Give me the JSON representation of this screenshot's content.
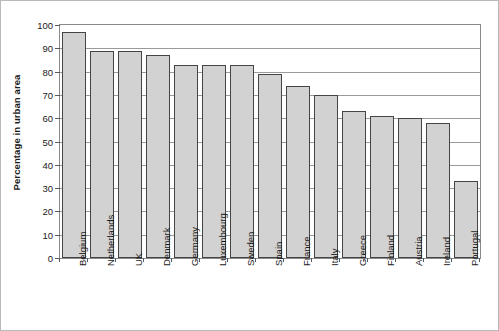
{
  "chart_data": {
    "type": "bar",
    "title": "",
    "subtitle": "",
    "xlabel": "",
    "ylabel": "Percentage in urban area",
    "ylim": [
      0,
      100
    ],
    "ytick_labels": [
      "0",
      "10",
      "20",
      "30",
      "40",
      "50",
      "60",
      "70",
      "80",
      "90",
      "100"
    ],
    "yticks": [
      0,
      10,
      20,
      30,
      40,
      50,
      60,
      70,
      80,
      90,
      100
    ],
    "grid": "horizontal",
    "legend": "none",
    "categories": [
      "Belgium",
      "Netherlands",
      "UK",
      "Denmark",
      "Germany",
      "Luxembourg",
      "Sweden",
      "Spain",
      "France",
      "Italy",
      "Greece",
      "Finland",
      "Austria",
      "Ireland",
      "Portugal"
    ],
    "values": [
      97,
      89,
      89,
      87,
      83,
      83,
      83,
      79,
      74,
      70,
      63,
      61,
      60,
      58,
      33
    ],
    "bar_fill_color": "#d2d2d2",
    "bar_border_color": "#454545",
    "gridline_color": "#9a9a9a",
    "axis_color": "#8a8a8a",
    "frame_border_color": "#b9b9b9"
  }
}
